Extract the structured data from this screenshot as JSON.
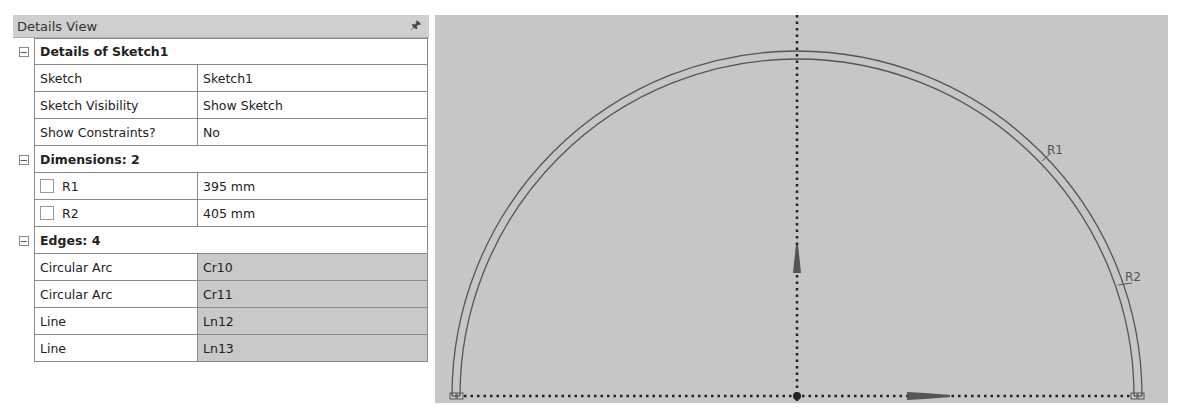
{
  "panel": {
    "title": "Details View",
    "pin_icon": "pin-icon",
    "groups": [
      {
        "label": "Details of Sketch1",
        "rows": [
          {
            "name": "Sketch",
            "value": "Sketch1"
          },
          {
            "name": "Sketch Visibility",
            "value": "Show Sketch"
          },
          {
            "name": "Show Constraints?",
            "value": "No"
          }
        ]
      },
      {
        "label": "Dimensions: 2",
        "rows": [
          {
            "name": "R1",
            "value": "395 mm"
          },
          {
            "name": "R2",
            "value": "405 mm"
          }
        ]
      },
      {
        "label": "Edges: 4",
        "rows": [
          {
            "name": "Circular Arc",
            "value": "Cr10"
          },
          {
            "name": "Circular Arc",
            "value": "Cr11"
          },
          {
            "name": "Line",
            "value": "Ln12"
          },
          {
            "name": "Line",
            "value": "Ln13"
          }
        ]
      }
    ],
    "collapse_glyph": "−"
  },
  "viewport": {
    "dimensions": [
      {
        "label": "R1"
      },
      {
        "label": "R2"
      }
    ],
    "colors": {
      "background": "#c6c6c6",
      "sketch_line": "#555555",
      "axis_dots": "#222222"
    }
  }
}
